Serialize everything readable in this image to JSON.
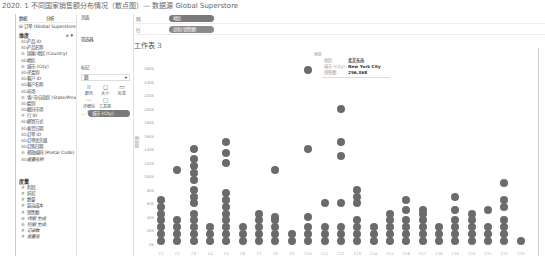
{
  "caption": "2020. 1 不同国家销售额分布情况（散点图）— 数据源 Global Superstore",
  "data_pane": {
    "tabs": [
      "数据",
      "分析"
    ],
    "source": "订单 (Global Superstore)",
    "dimensions_title": "维度",
    "dimensions": [
      {
        "glyph": "Abc",
        "label": "产品 ID"
      },
      {
        "glyph": "Abc",
        "label": "产品名称"
      },
      {
        "glyph": "⊕",
        "label": "国家/地区 (Country)"
      },
      {
        "glyph": "Abc",
        "label": "地区"
      },
      {
        "glyph": "⊕",
        "label": "城市 (City)"
      },
      {
        "glyph": "Abc",
        "label": "子类别"
      },
      {
        "glyph": "Abc",
        "label": "客户 ID"
      },
      {
        "glyph": "Abc",
        "label": "客户名称"
      },
      {
        "glyph": "Abc",
        "label": "市场"
      },
      {
        "glyph": "⊕",
        "label": "省/市/自治区 (State/Prov..."
      },
      {
        "glyph": "Abc",
        "label": "类别"
      },
      {
        "glyph": "Abc",
        "label": "细分市场"
      },
      {
        "glyph": "#",
        "label": "行 ID"
      },
      {
        "glyph": "Abc",
        "label": "邮寄方式"
      },
      {
        "glyph": "Abc",
        "label": "发货日期"
      },
      {
        "glyph": "Abc",
        "label": "订单 ID"
      },
      {
        "glyph": "Abc",
        "label": "订单优先级"
      },
      {
        "glyph": "Abc",
        "label": "订购日期"
      },
      {
        "glyph": "⊕",
        "label": "邮政编码 (Postal Code)"
      },
      {
        "glyph": "Abc",
        "label": "度量名称",
        "italic": true
      }
    ],
    "measures_title": "度量",
    "measures": [
      {
        "glyph": "#",
        "label": "利润"
      },
      {
        "glyph": "#",
        "label": "折扣"
      },
      {
        "glyph": "#",
        "label": "数量"
      },
      {
        "glyph": "#",
        "label": "装运成本"
      },
      {
        "glyph": "#",
        "label": "销售额"
      },
      {
        "glyph": "⊕",
        "label": "纬度(生成)",
        "italic": true
      },
      {
        "glyph": "⊕",
        "label": "经度(生成)",
        "italic": true
      },
      {
        "glyph": "#",
        "label": "记录数",
        "italic": true
      },
      {
        "glyph": "#",
        "label": "度量值",
        "italic": true
      }
    ]
  },
  "cards": {
    "pages": "页面",
    "filters": "筛选器",
    "marks": "标记",
    "mark_type": "圆",
    "mark_buttons": [
      {
        "icon": "⁞⁞",
        "label": "颜色"
      },
      {
        "icon": "◻",
        "label": "大小"
      },
      {
        "icon": "▭",
        "label": "标签"
      },
      {
        "icon": "⋯",
        "label": "详细信息"
      },
      {
        "icon": "▢",
        "label": "工具提示"
      }
    ],
    "detail_pill": "城市 (City)"
  },
  "shelves": {
    "columns_label": "列",
    "columns_pill": "地区",
    "rows_label": "行",
    "rows_pill": "总和(销售额)"
  },
  "sheet": {
    "title": "工作表 3",
    "column_header": "地区",
    "y_axis_label": "销售额",
    "y_ticks": [
      "260K",
      "240K",
      "220K",
      "200K",
      "180K",
      "160K",
      "140K",
      "120K",
      "100K",
      "80K",
      "60K",
      "40K",
      "20K",
      "0K"
    ]
  },
  "tooltip": {
    "rows": [
      {
        "key": "地区:",
        "value": "北美东南"
      },
      {
        "key": "城市 (City):",
        "value": "New York City"
      },
      {
        "key": "销售额:",
        "value": "256,368"
      }
    ]
  },
  "chart_data": {
    "type": "scatter",
    "title": "工作表 3",
    "xlabel": "地区",
    "ylabel": "销售额",
    "ylim": [
      0,
      260000
    ],
    "categories": [
      "C1",
      "C2",
      "C3",
      "C4",
      "C5",
      "C6",
      "C7",
      "C8",
      "C9",
      "C10",
      "C11",
      "C12",
      "C13",
      "C14",
      "C15",
      "C16",
      "C17",
      "C18",
      "C19",
      "C20",
      "C21",
      "C22",
      "C23"
    ],
    "columns": [
      {
        "x": 0,
        "values": [
          5000,
          15000,
          25000,
          35000,
          45000,
          55000,
          65000
        ]
      },
      {
        "x": 1,
        "values": [
          5000,
          15000,
          25000,
          35000,
          110000
        ]
      },
      {
        "x": 2,
        "values": [
          5000,
          15000,
          25000,
          35000,
          45000,
          60000,
          70000,
          80000,
          95000,
          105000,
          115000,
          125000,
          140000
        ]
      },
      {
        "x": 3,
        "values": [
          5000,
          15000,
          25000
        ]
      },
      {
        "x": 4,
        "values": [
          5000,
          15000,
          25000,
          35000,
          45000,
          55000,
          65000,
          75000,
          120000,
          135000,
          150000
        ]
      },
      {
        "x": 5,
        "values": [
          5000,
          15000,
          25000
        ]
      },
      {
        "x": 6,
        "values": [
          5000,
          15000,
          25000,
          35000,
          45000
        ]
      },
      {
        "x": 7,
        "values": [
          5000,
          15000,
          25000,
          35000,
          40000,
          110000
        ]
      },
      {
        "x": 8,
        "values": [
          5000,
          15000
        ]
      },
      {
        "x": 9,
        "values": [
          5000,
          15000,
          25000,
          40000,
          140000,
          256368
        ]
      },
      {
        "x": 10,
        "values": [
          5000,
          15000,
          25000,
          60000
        ]
      },
      {
        "x": 11,
        "values": [
          5000,
          15000,
          25000,
          60000,
          130000,
          150000,
          200000
        ]
      },
      {
        "x": 12,
        "values": [
          5000,
          15000,
          25000,
          35000,
          60000,
          70000,
          80000
        ]
      },
      {
        "x": 13,
        "values": [
          5000,
          15000,
          25000
        ]
      },
      {
        "x": 14,
        "values": [
          5000,
          15000,
          25000,
          35000,
          45000
        ]
      },
      {
        "x": 15,
        "values": [
          5000,
          15000,
          25000,
          35000,
          50000,
          65000
        ]
      },
      {
        "x": 16,
        "values": [
          5000,
          15000,
          25000,
          35000,
          45000,
          50000
        ]
      },
      {
        "x": 17,
        "values": [
          5000,
          15000,
          25000
        ]
      },
      {
        "x": 18,
        "values": [
          5000,
          15000,
          25000,
          35000,
          50000,
          70000
        ]
      },
      {
        "x": 19,
        "values": [
          5000,
          15000,
          25000,
          35000,
          45000
        ]
      },
      {
        "x": 20,
        "values": [
          5000,
          15000,
          25000,
          50000
        ]
      },
      {
        "x": 21,
        "values": [
          5000,
          15000,
          25000,
          35000,
          55000,
          65000,
          90000
        ]
      },
      {
        "x": 22,
        "values": [
          5000
        ]
      }
    ],
    "grid": false,
    "legend": "none"
  }
}
